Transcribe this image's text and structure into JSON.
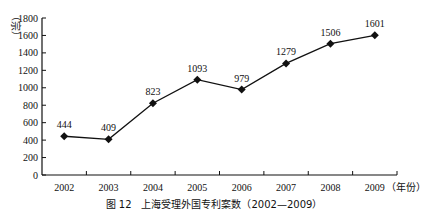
{
  "chart_data": {
    "type": "line",
    "title": "",
    "caption": "图 12　上海受理外国专利案数（2002—2009）",
    "xlabel": "（年份）",
    "ylabel": "（宗）",
    "categories": [
      "2002",
      "2003",
      "2004",
      "2005",
      "2006",
      "2007",
      "2008",
      "2009"
    ],
    "values": [
      444,
      409,
      823,
      1093,
      979,
      1279,
      1506,
      1601
    ],
    "data_labels": [
      "444",
      "409",
      "823",
      "1093",
      "979",
      "1279",
      "1506",
      "1601"
    ],
    "ylim": [
      0,
      1800
    ],
    "yticks": [
      "0",
      "200",
      "400",
      "600",
      "800",
      "1000",
      "1200",
      "1400",
      "1600",
      "1800"
    ],
    "grid": false,
    "legend": null,
    "marker": "diamond",
    "line_color": "#111111"
  }
}
